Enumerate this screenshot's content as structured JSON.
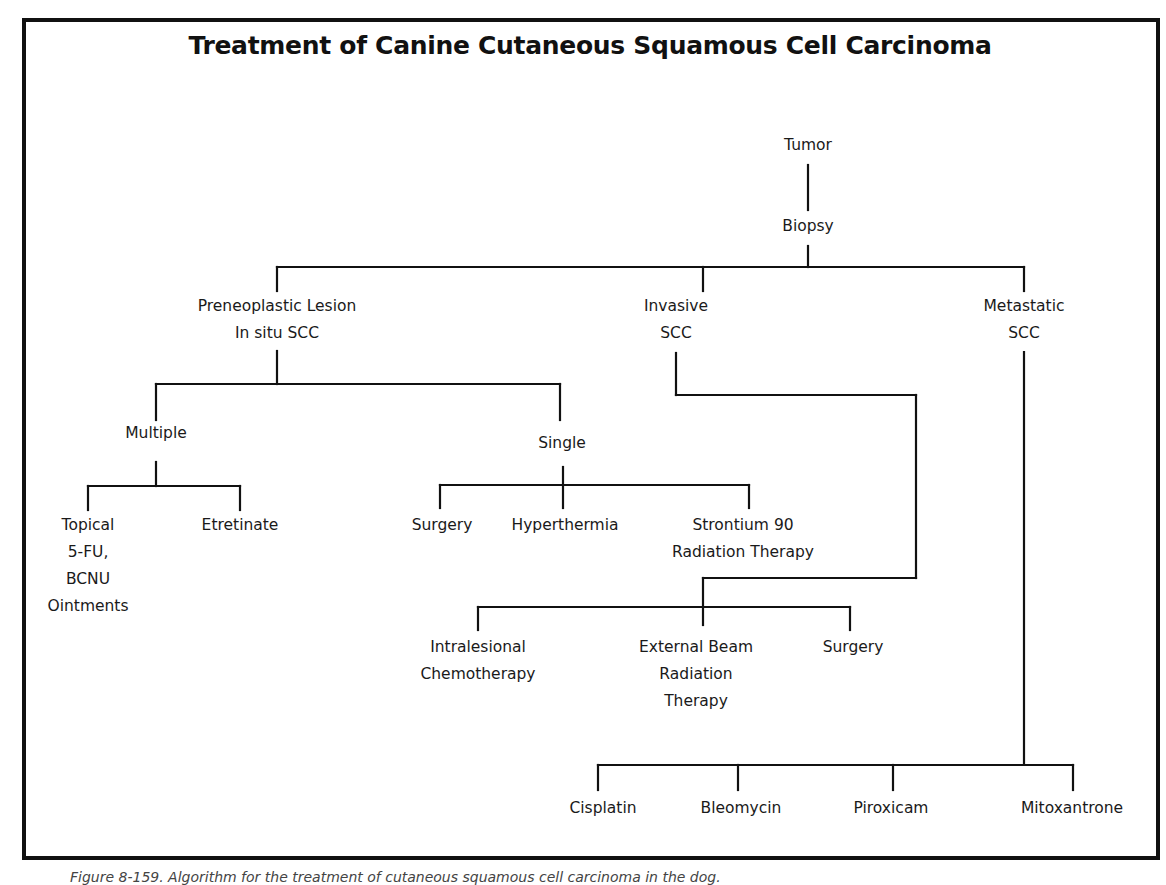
{
  "title": "Treatment of Canine Cutaneous Squamous Cell Carcinoma",
  "nodes": {
    "tumor": "Tumor",
    "biopsy": "Biopsy",
    "preneoplastic_line1": "Preneoplastic Lesion",
    "preneoplastic_line2": "In situ SCC",
    "invasive_line1": "Invasive",
    "invasive_line2": "SCC",
    "metastatic_line1": "Metastatic",
    "metastatic_line2": "SCC",
    "multiple": "Multiple",
    "single": "Single",
    "topical_line1": "Topical",
    "topical_line2": "5-FU,",
    "topical_line3": "BCNU",
    "topical_line4": "Ointments",
    "etretinate": "Etretinate",
    "single_surgery": "Surgery",
    "hyperthermia": "Hyperthermia",
    "strontium_line1": "Strontium 90",
    "strontium_line2": "Radiation Therapy",
    "intralesional_line1": "Intralesional",
    "intralesional_line2": "Chemotherapy",
    "external_line1": "External Beam",
    "external_line2": "Radiation",
    "external_line3": "Therapy",
    "invasive_surgery": "Surgery",
    "cisplatin": "Cisplatin",
    "bleomycin": "Bleomycin",
    "piroxicam": "Piroxicam",
    "mitoxantrone": "Mitoxantrone"
  },
  "caption": "Figure 8-159. Algorithm for the treatment of cutaneous squamous cell carcinoma in the dog."
}
